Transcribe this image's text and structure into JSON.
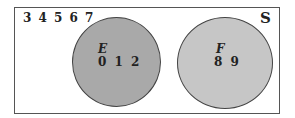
{
  "diagram": {
    "type": "venn",
    "universe_label": "S",
    "outside_elements": "3 4 5 6 7",
    "sets": [
      {
        "label": "E",
        "elements": "0 1 2",
        "fill": "#a9a9a9"
      },
      {
        "label": "F",
        "elements": "8 9",
        "fill": "#c6c6c6"
      }
    ]
  }
}
